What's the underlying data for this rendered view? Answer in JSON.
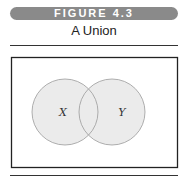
{
  "figure": {
    "label": "FIGURE 4.3",
    "title": "A Union"
  },
  "diagram": {
    "type": "venn",
    "sets": [
      {
        "name": "X",
        "cx": 65,
        "cy": 112,
        "r": 33
      },
      {
        "name": "Y",
        "cx": 112,
        "cy": 112,
        "r": 33
      }
    ],
    "shaded": "union",
    "colors": {
      "banner": "#8a8a8a",
      "fill": "#e9e9e9",
      "stroke": "#9a9a9a",
      "frame": "#222222"
    }
  }
}
